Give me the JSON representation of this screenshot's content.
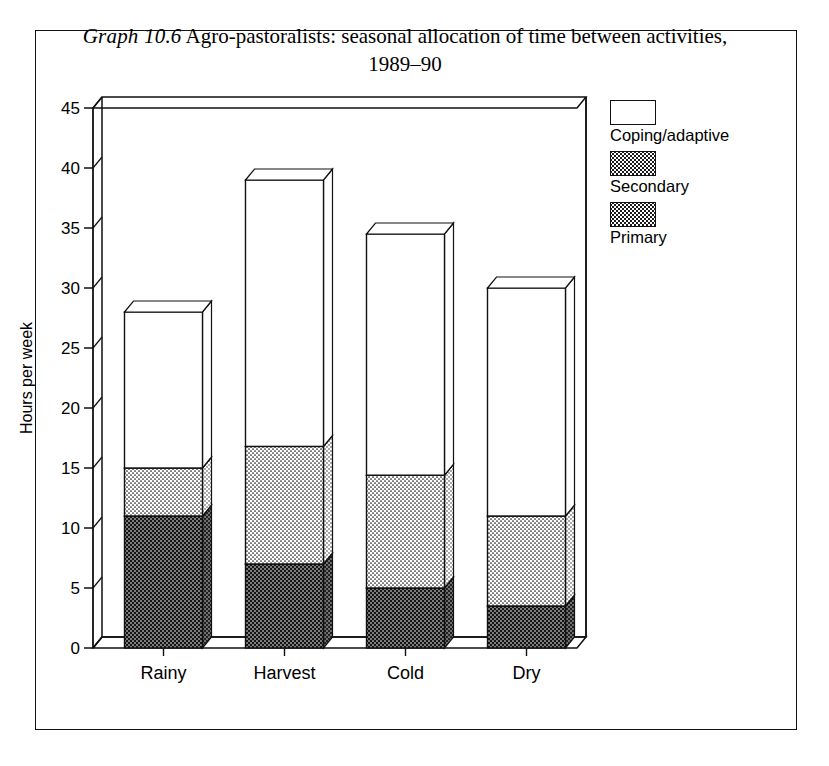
{
  "caption": {
    "label": "Graph 10.6",
    "text": "Agro-pastoralists: seasonal allocation of time between activities,",
    "line2": "1989–90"
  },
  "legend": {
    "items": [
      {
        "key": "coping",
        "label": "Coping/adaptive",
        "swatch": "white-empty"
      },
      {
        "key": "secondary",
        "label": "Secondary",
        "swatch": "light-dotted"
      },
      {
        "key": "primary",
        "label": "Primary",
        "swatch": "dark-dotted"
      }
    ]
  },
  "chart_data": {
    "type": "bar",
    "stacked": true,
    "title": "Agro-pastoralists: seasonal allocation of time between activities, 1989–90",
    "xlabel": "",
    "ylabel": "Hours per week",
    "categories": [
      "Rainy",
      "Harvest",
      "Cold",
      "Dry"
    ],
    "series": [
      {
        "name": "Primary",
        "values": [
          11.0,
          7.0,
          5.0,
          3.5
        ]
      },
      {
        "name": "Secondary",
        "values": [
          4.0,
          9.8,
          9.4,
          7.5
        ]
      },
      {
        "name": "Coping/adaptive",
        "values": [
          13.0,
          22.2,
          20.1,
          19.0
        ]
      }
    ],
    "totals": [
      28.0,
      39.0,
      34.5,
      30.0
    ],
    "cumulative_tops": {
      "primary": [
        11.0,
        7.0,
        5.0,
        3.5
      ],
      "secondary": [
        15.0,
        16.8,
        14.4,
        11.0
      ],
      "coping": [
        28.0,
        39.0,
        34.5,
        30.0
      ]
    },
    "ylim": [
      0,
      45
    ],
    "yticks": [
      0,
      5,
      10,
      15,
      20,
      25,
      30,
      35,
      40,
      45
    ],
    "ytick_labels": [
      "0",
      "5",
      "10",
      "15",
      "20",
      "25",
      "30",
      "35",
      "40",
      "45"
    ],
    "grid": false,
    "legend_position": "right",
    "style": "3d-perspective"
  },
  "colors": {
    "ink": "#111111",
    "paper": "#ffffff",
    "primary_fill": "#1a1a1a",
    "secondary_fill": "#ffffff"
  }
}
